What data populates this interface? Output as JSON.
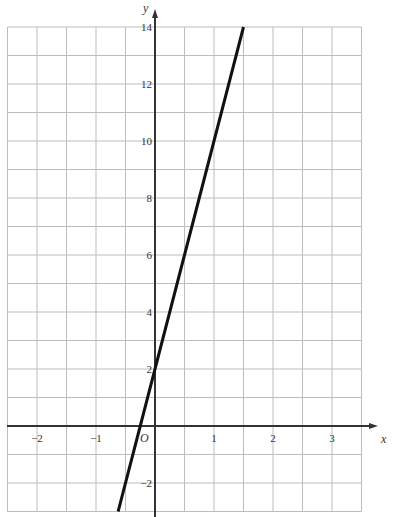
{
  "chart_data": {
    "type": "line",
    "title": "",
    "xlabel": "x",
    "ylabel": "y",
    "origin_label": "O",
    "xlim": [
      -2.5,
      3.5
    ],
    "ylim": [
      -3,
      14
    ],
    "grid": true,
    "grid_step_x": 0.5,
    "grid_step_y": 1,
    "x_ticks": [
      -2,
      -1,
      1,
      2,
      3
    ],
    "x_tick_labels": [
      "−2",
      "−1",
      "1",
      "2",
      "3"
    ],
    "y_ticks": [
      -2,
      2,
      4,
      6,
      8,
      10,
      12,
      14
    ],
    "y_tick_labels": [
      "−2",
      "2",
      "4",
      "6",
      "8",
      "10",
      "12",
      "14"
    ],
    "series": [
      {
        "name": "y = 8x + 2",
        "equation": "y = 8x + 2",
        "x": [
          -0.625,
          -0.25,
          0,
          0.5,
          1,
          1.5
        ],
        "y": [
          -3,
          0,
          2,
          6,
          10,
          14
        ]
      }
    ],
    "colors": {
      "grid": "#bdbdbd",
      "axis": "#333333",
      "line": "#111111"
    }
  }
}
